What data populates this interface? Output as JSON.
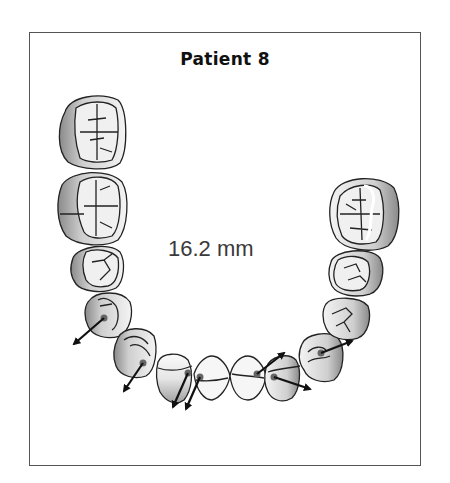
{
  "figure": {
    "title": "Patient 8",
    "measurement": "16.2 mm"
  },
  "dental_arch": {
    "view": "occlusal",
    "teeth": [
      {
        "id": "left-molar-1",
        "type": "molar",
        "side": "left"
      },
      {
        "id": "left-molar-2",
        "type": "molar",
        "side": "left"
      },
      {
        "id": "left-premolar-1",
        "type": "premolar",
        "side": "left"
      },
      {
        "id": "left-premolar-2",
        "type": "premolar",
        "side": "left",
        "arrow": true
      },
      {
        "id": "left-canine",
        "type": "canine",
        "side": "left",
        "arrow": true
      },
      {
        "id": "left-lateral-incisor",
        "type": "incisor",
        "side": "left",
        "arrow": true
      },
      {
        "id": "left-central-incisor",
        "type": "incisor",
        "side": "left",
        "arrow": true
      },
      {
        "id": "right-central-incisor",
        "type": "incisor",
        "side": "right",
        "arrow": true
      },
      {
        "id": "right-lateral-incisor",
        "type": "incisor",
        "side": "right",
        "arrow": true
      },
      {
        "id": "right-canine",
        "type": "canine",
        "side": "right",
        "arrow": true
      },
      {
        "id": "right-premolar-2",
        "type": "premolar",
        "side": "right"
      },
      {
        "id": "right-premolar-1",
        "type": "premolar",
        "side": "right"
      },
      {
        "id": "right-molar-1",
        "type": "molar",
        "side": "right"
      }
    ]
  },
  "colors": {
    "border": "#555555",
    "outline": "#222222",
    "shade": "#9a9a9a",
    "fill": "#f2f2f2",
    "dot": "#666666",
    "arrow": "#111111"
  }
}
